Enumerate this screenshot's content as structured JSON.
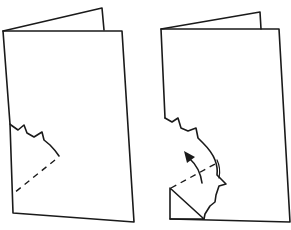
{
  "diagram": {
    "panels": [
      {
        "id": "step-1",
        "label": "",
        "content": "folded card with cut edge and dashed fold line"
      },
      {
        "id": "step-2",
        "label": "",
        "content": "card with corner folded along dashed line, arrow showing fold direction"
      }
    ],
    "colors": {
      "stroke": "#1a1a1a",
      "background": "#ffffff"
    }
  }
}
